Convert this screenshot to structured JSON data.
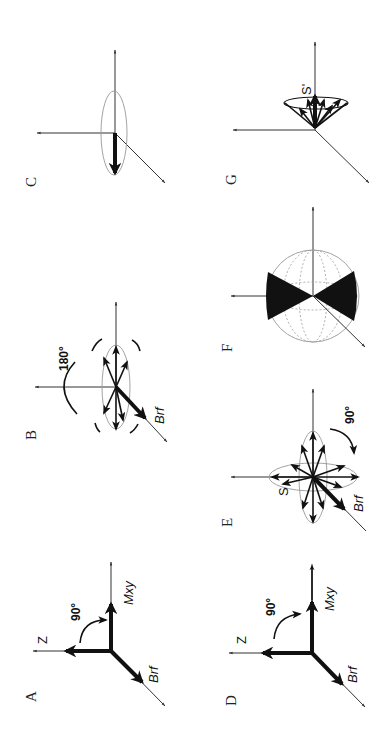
{
  "figure": {
    "orientation": "rotated 90 degrees counter-clockwise",
    "panels": [
      {
        "id": "A",
        "label": "A",
        "axis_labels": {
          "z": "Z",
          "transverse": "Mxy",
          "rf": "Brf"
        },
        "angle": "90°"
      },
      {
        "id": "B",
        "label": "B",
        "axis_labels": {
          "rf": "Brf"
        },
        "angle": "180°"
      },
      {
        "id": "C",
        "label": "C"
      },
      {
        "id": "D",
        "label": "D",
        "axis_labels": {
          "z": "Z",
          "transverse": "Mxy",
          "rf": "Brf"
        },
        "angle": "90°"
      },
      {
        "id": "E",
        "label": "E",
        "axis_labels": {
          "spin": "S",
          "rf": "Brf"
        },
        "angle": "90°"
      },
      {
        "id": "F",
        "label": "F"
      },
      {
        "id": "G",
        "label": "G",
        "axis_labels": {
          "spin": "S'"
        }
      }
    ]
  },
  "colors": {
    "ink": "#111111",
    "axis": "#333333",
    "ellipse": "#999999",
    "background": "#ffffff"
  }
}
